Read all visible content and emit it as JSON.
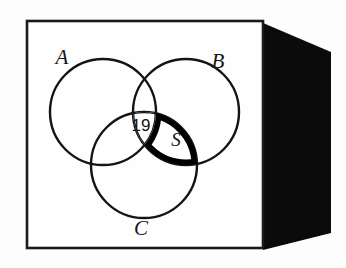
{
  "figure": {
    "kind": "venn-diagram",
    "title": "",
    "card": {
      "face_color": "#fefefe",
      "border_color": "#1a1a1a",
      "side_color": "#0b0b0b",
      "background_color": "#ffffff"
    },
    "sets": [
      {
        "id": "A",
        "label": "A",
        "label_x": 62,
        "label_y": 64,
        "cx": 103,
        "cy": 112,
        "r": 53
      },
      {
        "id": "B",
        "label": "B",
        "label_x": 218,
        "label_y": 68,
        "cx": 186,
        "cy": 112,
        "r": 53
      },
      {
        "id": "C",
        "label": "C",
        "label_x": 141,
        "label_y": 235,
        "cx": 144,
        "cy": 165,
        "r": 53
      }
    ],
    "regions": [
      {
        "id": "triple-intersection",
        "name": "A-and-B-and-C",
        "label": "19",
        "label_x": 141,
        "label_y": 131,
        "fill": "#ffffff",
        "outline": "thin"
      },
      {
        "id": "highlighted-region",
        "name": "B-and-C-not-A",
        "label": "S",
        "label_x": 176,
        "label_y": 145,
        "fill": "#ffffff",
        "outline": "thick",
        "outline_width_px": 6
      }
    ],
    "stroke_width_px": 2.2
  }
}
